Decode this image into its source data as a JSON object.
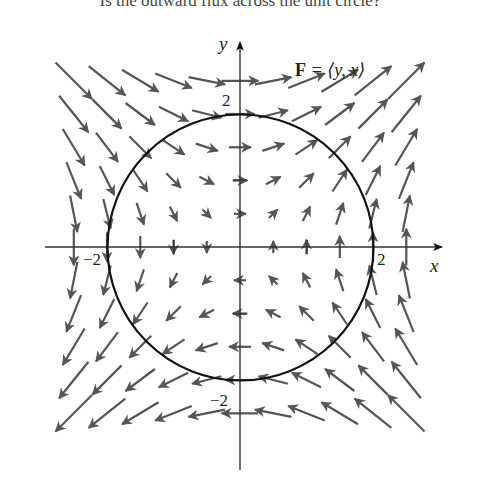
{
  "caption": "Is the outward flux across the unit circle?",
  "diagram": {
    "field_label_bold": "F",
    "field_label_rest": " = ⟨y, x⟩",
    "x_axis_label": "x",
    "y_axis_label": "y",
    "tick_labels": {
      "x_neg": "−2",
      "x_pos": "2",
      "y_pos": "2",
      "y_neg": "−2"
    },
    "circle_radius": 2,
    "colors": {
      "axis": "#333333",
      "circle": "#111111",
      "arrow": "#555555"
    }
  },
  "chart_data": {
    "type": "vector_field",
    "title": "F = ⟨y, x⟩",
    "xlabel": "x",
    "ylabel": "y",
    "xlim": [
      -2.6,
      3.1
    ],
    "ylim": [
      -3.0,
      3.4
    ],
    "ticks": [
      -2,
      -1,
      1,
      2
    ],
    "field": {
      "Fx": "y",
      "Fy": "x"
    },
    "grid_points": {
      "x": [
        -2.5,
        -2,
        -1.5,
        -1,
        -0.5,
        0,
        0.5,
        1,
        1.5,
        2,
        2.5
      ],
      "y": [
        -2.5,
        -2,
        -1.5,
        -1,
        -0.5,
        0,
        0.5,
        1,
        1.5,
        2,
        2.5
      ]
    },
    "curves": [
      {
        "type": "circle",
        "center": [
          0,
          0
        ],
        "radius": 2
      }
    ]
  }
}
